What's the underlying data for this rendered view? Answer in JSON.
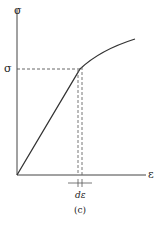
{
  "diagram": {
    "type": "stress-strain curve",
    "y_axis_label": "σ",
    "x_axis_label": "ε",
    "marked_stress_label": "σ",
    "strain_increment_label": "dε",
    "caption": "(c)",
    "colors": {
      "line": "#333333",
      "dashed": "#555555",
      "background": "#ffffff"
    }
  }
}
